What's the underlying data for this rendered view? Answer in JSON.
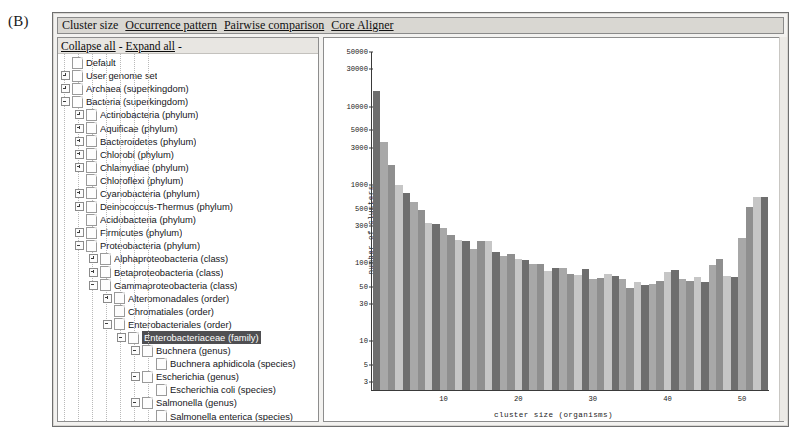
{
  "figure": {
    "label": "(B)"
  },
  "tabs": [
    {
      "label": "Cluster size",
      "active": true
    },
    {
      "label": "Occurrence pattern",
      "active": false
    },
    {
      "label": "Pairwise comparison",
      "active": false
    },
    {
      "label": "Core Aligner",
      "active": false
    }
  ],
  "tree_toolbar": {
    "collapse_all": "Collapse all",
    "separator": "-",
    "expand_all": "Expand all",
    "trailing": "-"
  },
  "tree": [
    {
      "label": "Default",
      "depth": 0,
      "twisty": "none",
      "selected": false
    },
    {
      "label": "User genome set",
      "depth": 0,
      "twisty": "plus",
      "selected": false
    },
    {
      "label": "Archaea (superkingdom)",
      "depth": 0,
      "twisty": "plus",
      "selected": false
    },
    {
      "label": "Bacteria (superkingdom)",
      "depth": 0,
      "twisty": "minus",
      "selected": false
    },
    {
      "label": "Actinobacteria (phylum)",
      "depth": 1,
      "twisty": "plus",
      "selected": false
    },
    {
      "label": "Aquificae (phylum)",
      "depth": 1,
      "twisty": "plus",
      "selected": false
    },
    {
      "label": "Bacteroidetes (phylum)",
      "depth": 1,
      "twisty": "plus",
      "selected": false
    },
    {
      "label": "Chlorobi (phylum)",
      "depth": 1,
      "twisty": "plus",
      "selected": false
    },
    {
      "label": "Chlamydiae (phylum)",
      "depth": 1,
      "twisty": "plus",
      "selected": false
    },
    {
      "label": "Chloroflexi (phylum)",
      "depth": 1,
      "twisty": "none",
      "selected": false
    },
    {
      "label": "Cyanobacteria (phylum)",
      "depth": 1,
      "twisty": "plus",
      "selected": false
    },
    {
      "label": "Deinococcus-Thermus (phylum)",
      "depth": 1,
      "twisty": "plus",
      "selected": false
    },
    {
      "label": "Acidobacteria (phylum)",
      "depth": 1,
      "twisty": "none",
      "selected": false
    },
    {
      "label": "Firmicutes (phylum)",
      "depth": 1,
      "twisty": "plus",
      "selected": false
    },
    {
      "label": "Proteobacteria (phylum)",
      "depth": 1,
      "twisty": "minus",
      "selected": false
    },
    {
      "label": "Alphaproteobacteria (class)",
      "depth": 2,
      "twisty": "plus",
      "selected": false
    },
    {
      "label": "Betaproteobacteria (class)",
      "depth": 2,
      "twisty": "plus",
      "selected": false
    },
    {
      "label": "Gammaproteobacteria (class)",
      "depth": 2,
      "twisty": "minus",
      "selected": false
    },
    {
      "label": "Alteromonadales (order)",
      "depth": 3,
      "twisty": "plus",
      "selected": false
    },
    {
      "label": "Chromatiales (order)",
      "depth": 3,
      "twisty": "none",
      "selected": false
    },
    {
      "label": "Enterobacteriales (order)",
      "depth": 3,
      "twisty": "minus",
      "selected": false
    },
    {
      "label": "Enterobacteriaceae (family)",
      "depth": 4,
      "twisty": "minus",
      "selected": true
    },
    {
      "label": "Buchnera (genus)",
      "depth": 5,
      "twisty": "minus",
      "selected": false
    },
    {
      "label": "Buchnera aphidicola (species)",
      "depth": 6,
      "twisty": "none",
      "selected": false
    },
    {
      "label": "Escherichia (genus)",
      "depth": 5,
      "twisty": "minus",
      "selected": false
    },
    {
      "label": "Escherichia coli (species)",
      "depth": 6,
      "twisty": "none",
      "selected": false
    },
    {
      "label": "Salmonella (genus)",
      "depth": 5,
      "twisty": "minus",
      "selected": false
    },
    {
      "label": "Salmonella enterica (species)",
      "depth": 6,
      "twisty": "none",
      "selected": false
    },
    {
      "label": "Yersinia (genus)",
      "depth": 5,
      "twisty": "plus",
      "selected": false
    },
    {
      "label": "Legionellales (order)",
      "depth": 3,
      "twisty": "plus",
      "selected": false
    },
    {
      "label": "Legionellaceae (family)",
      "depth": 4,
      "twisty": "plus",
      "selected": false
    },
    {
      "label": "Oceanospirillales (order)",
      "depth": 3,
      "twisty": "none",
      "selected": false
    },
    {
      "label": "Pasteurellales (order)",
      "depth": 3,
      "twisty": "minus",
      "selected": false
    },
    {
      "label": "Pasteurellaceae (family)",
      "depth": 4,
      "twisty": "plus",
      "selected": false
    },
    {
      "label": "Pseudomonadales (order)",
      "depth": 3,
      "twisty": "plus",
      "selected": false
    }
  ],
  "chart_data": {
    "type": "bar",
    "title": "",
    "xlabel": "cluster size (organisms)",
    "ylabel": "number of clusters",
    "yscale": "log",
    "ylim": [
      2.4,
      50000
    ],
    "xlim": [
      0.4,
      53.6
    ],
    "grid": false,
    "legend": null,
    "ytick_labels": [
      "50000",
      "30000",
      "10000",
      "5000",
      "3000",
      "1000",
      "500",
      "300",
      "100",
      "50",
      "30",
      "10",
      "5",
      "3"
    ],
    "ytick_values": [
      50000,
      30000,
      10000,
      5000,
      3000,
      1000,
      500,
      300,
      100,
      50,
      30,
      10,
      5,
      3
    ],
    "xtick_labels": [
      "10",
      "20",
      "30",
      "40",
      "50"
    ],
    "xtick_values": [
      10,
      20,
      30,
      40,
      50
    ],
    "bar_colors": [
      "#6e6e6e",
      "#a8a8a8",
      "#8f8f8f",
      "#c6c6c6"
    ],
    "x": [
      1,
      2,
      3,
      4,
      5,
      6,
      7,
      8,
      9,
      10,
      11,
      12,
      13,
      14,
      15,
      16,
      17,
      18,
      19,
      20,
      21,
      22,
      23,
      24,
      25,
      26,
      27,
      28,
      29,
      30,
      31,
      32,
      33,
      34,
      35,
      36,
      37,
      38,
      39,
      40,
      41,
      42,
      43,
      44,
      45,
      46,
      47,
      48,
      49,
      50,
      51,
      52,
      53
    ],
    "values": [
      16000,
      3500,
      1800,
      1000,
      800,
      600,
      480,
      330,
      320,
      280,
      230,
      200,
      190,
      150,
      195,
      190,
      140,
      125,
      130,
      112,
      110,
      98,
      97,
      80,
      88,
      87,
      72,
      70,
      85,
      63,
      65,
      72,
      69,
      63,
      48,
      57,
      52,
      55,
      60,
      78,
      82,
      62,
      60,
      67,
      58,
      95,
      112,
      68,
      66,
      210,
      520,
      700,
      700
    ]
  }
}
